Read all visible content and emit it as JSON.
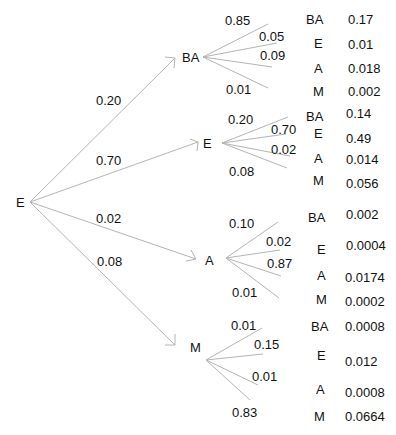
{
  "root": {
    "label": "E"
  },
  "first_level": [
    {
      "label": "BA",
      "prob": "0.20"
    },
    {
      "label": "E",
      "prob": "0.70"
    },
    {
      "label": "A",
      "prob": "0.02"
    },
    {
      "label": "M",
      "prob": "0.08"
    }
  ],
  "second_level": [
    {
      "parent": "BA",
      "branch_probs": [
        "0.85",
        "0.05",
        "0.09",
        "0.01"
      ],
      "outcomes": [
        {
          "label": "BA",
          "joint": "0.17"
        },
        {
          "label": "E",
          "joint": "0.01"
        },
        {
          "label": "A",
          "joint": "0.018"
        },
        {
          "label": "M",
          "joint": "0.002"
        }
      ]
    },
    {
      "parent": "E",
      "branch_probs": [
        "0.20",
        "0.70",
        "0.02",
        "0.08"
      ],
      "outcomes": [
        {
          "label": "BA",
          "joint": "0.14"
        },
        {
          "label": "E",
          "joint": "0.49"
        },
        {
          "label": "A",
          "joint": "0.014"
        },
        {
          "label": "M",
          "joint": "0.056"
        }
      ]
    },
    {
      "parent": "A",
      "branch_probs": [
        "0.10",
        "0.02",
        "0.87",
        "0.01"
      ],
      "outcomes": [
        {
          "label": "BA",
          "joint": "0.002"
        },
        {
          "label": "E",
          "joint": "0.0004"
        },
        {
          "label": "A",
          "joint": "0.0174"
        },
        {
          "label": "M",
          "joint": "0.0002"
        }
      ]
    },
    {
      "parent": "M",
      "branch_probs": [
        "0.01",
        "0.15",
        "0.01",
        "0.83"
      ],
      "outcomes": [
        {
          "label": "BA",
          "joint": "0.0008"
        },
        {
          "label": "E",
          "joint": "0.012"
        },
        {
          "label": "A",
          "joint": "0.0008"
        },
        {
          "label": "M",
          "joint": "0.0664"
        }
      ]
    }
  ],
  "colors": {
    "line": "#b4b4b4",
    "text": "#111111",
    "background": "#ffffff"
  }
}
